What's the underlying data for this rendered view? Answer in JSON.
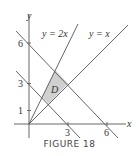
{
  "figure": {
    "caption": "FIGURE 18",
    "axes": {
      "x_label": "x",
      "y_label": "y",
      "x_ticks": [
        "3",
        "6"
      ],
      "y_ticks": [
        "1",
        "3",
        "6"
      ]
    },
    "lines": [
      {
        "label": "y = 2x"
      },
      {
        "label": "y = x"
      },
      {
        "label": "x + y = 3"
      },
      {
        "label": "x + y = 6"
      }
    ],
    "region": {
      "label": "D",
      "fill": "#d0d0d0",
      "vertices": [
        [
          1,
          2
        ],
        [
          1.5,
          1.5
        ],
        [
          3,
          3
        ],
        [
          2,
          4
        ]
      ]
    },
    "colors": {
      "line": "#555555",
      "region": "#d0d0d0"
    }
  }
}
